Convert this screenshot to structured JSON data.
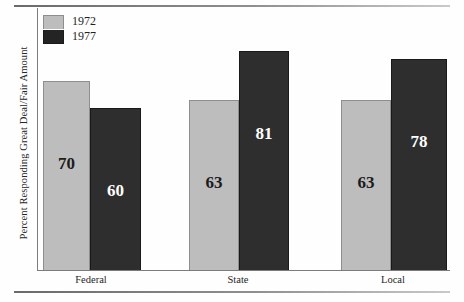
{
  "chart_data": {
    "type": "bar",
    "title": "",
    "subtitle": "",
    "xlabel": "",
    "ylabel": "Percent Responding Great Deal/Fair Amount",
    "categories": [
      "Federal",
      "State",
      "Local"
    ],
    "series": [
      {
        "name": "1972",
        "color": "#bdbdbd",
        "values": [
          70,
          63,
          63
        ]
      },
      {
        "name": "1977",
        "color": "#2e2e2e",
        "values": [
          60,
          81,
          78
        ]
      }
    ],
    "value_labels": [
      [
        "70",
        "60"
      ],
      [
        "63",
        "81"
      ],
      [
        "63",
        "78"
      ]
    ],
    "ylim": [
      0,
      100
    ],
    "grid": false,
    "legend_position": "top-left",
    "legend_entries": [
      "1972",
      "1977"
    ],
    "annotations": []
  },
  "legend": {
    "items": [
      {
        "label": "1972",
        "swatch": "light-gray-swatch"
      },
      {
        "label": "1977",
        "swatch": "black-swatch"
      }
    ]
  },
  "axes": {
    "y_title": "Percent Responding Great Deal/Fair Amount",
    "category_labels": [
      "Federal",
      "State",
      "Local"
    ]
  }
}
